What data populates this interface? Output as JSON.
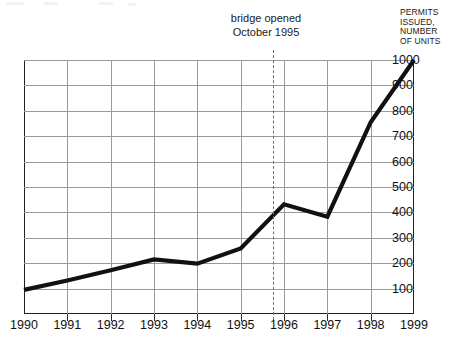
{
  "chart_data": {
    "type": "line",
    "title": "",
    "subtitle": "",
    "xlabel": "",
    "ylabel": "PERMITS\nISSUED,\nNUMBER\nOF UNITS",
    "ylabel_lines": [
      "PERMITS",
      "ISSUED,",
      "NUMBER",
      "OF UNITS"
    ],
    "categories": [
      "1990",
      "1991",
      "1992",
      "1993",
      "1994",
      "1995",
      "1996",
      "1997",
      "1998",
      "1999"
    ],
    "x": [
      1990,
      1991,
      1992,
      1993,
      1994,
      1995,
      1996,
      1997,
      1998,
      1999
    ],
    "values": [
      95,
      132,
      172,
      215,
      198,
      258,
      432,
      383,
      755,
      1000
    ],
    "series": [
      {
        "name": "Permits issued",
        "values": [
          95,
          132,
          172,
          215,
          198,
          258,
          432,
          383,
          755,
          1000
        ]
      }
    ],
    "ylim": [
      0,
      1000
    ],
    "xlim": [
      1990,
      1999
    ],
    "ytick_labels": [
      "100",
      "200",
      "300",
      "400",
      "500",
      "600",
      "700",
      "800",
      "900",
      "1000"
    ],
    "ytick_values": [
      100,
      200,
      300,
      400,
      500,
      600,
      700,
      800,
      900,
      1000
    ],
    "xtick_labels": [
      "1990",
      "1991",
      "1992",
      "1993",
      "1994",
      "1995",
      "1996",
      "1997",
      "1998",
      "1999"
    ],
    "grid": true,
    "legend": "none",
    "line_color": "#111111",
    "grid_color": "#9a9a9a",
    "axis_color": "#202020",
    "annotations": [
      {
        "text": "bridge opened\nOctober 1995",
        "line1": "bridge opened",
        "line2": "October 1995",
        "x_value": 1995.75,
        "style": "dashed-vertical-line",
        "color": "#6e6e6e"
      }
    ]
  },
  "annotation": {
    "text": "bridge opened\nOctober 1995"
  },
  "axis": {
    "y_title": "PERMITS\nISSUED,\nNUMBER\nOF UNITS"
  }
}
